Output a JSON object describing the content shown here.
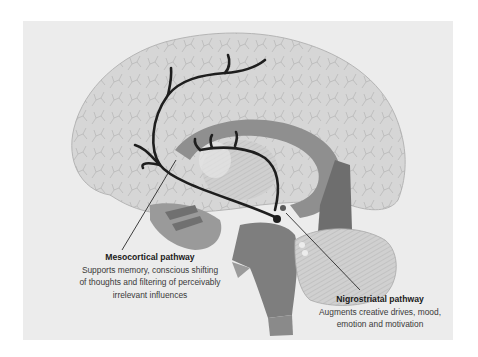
{
  "figure": {
    "colors": {
      "background": "#ffffff",
      "panel": "#ececec",
      "cortex": "#d6d6d6",
      "cortex_veins": "#a9a9a9",
      "deep_structures": "#8f8f8f",
      "dark_structures": "#6e6e6e",
      "pathway": "#1e1e1e",
      "text_title": "#1a1a1a",
      "text_body": "#3a3a3a"
    }
  },
  "labels": {
    "mesocortical": {
      "title": "Mesocortical pathway",
      "line1": "Supports memory, conscious shifting",
      "line2": "of thoughts and filtering of perceivably",
      "line3": "irrelevant influences"
    },
    "nigrostriatal": {
      "title": "Nigrostriatal pathway",
      "line1": "Augments creative drives, mood,",
      "line2": "emotion and motivation"
    }
  }
}
